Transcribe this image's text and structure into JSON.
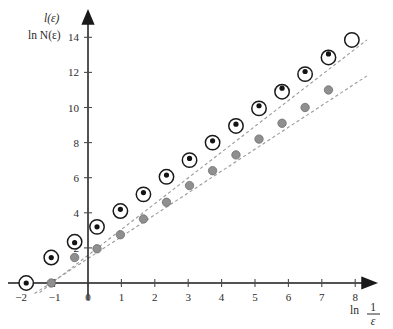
{
  "chart_data": {
    "type": "scatter",
    "title": "",
    "xlabel": "ln 1/ε",
    "ylabel_line1": "l(ε)",
    "ylabel_line2": "ln N(ε)",
    "xlim": [
      -2.4,
      8.6
    ],
    "ylim": [
      -0.9,
      14.9
    ],
    "xticks": [
      -2,
      -1,
      0,
      1,
      2,
      3,
      4,
      5,
      6,
      7,
      8
    ],
    "xticklabels": [
      "−2",
      "−1",
      "0",
      "1",
      "2",
      "3",
      "4",
      "5",
      "6",
      "7",
      "8"
    ],
    "yticks": [
      2,
      4,
      6,
      8,
      10,
      12,
      14
    ],
    "yticklabels": [
      "2",
      "4",
      "6",
      "8",
      "10",
      "12",
      "14"
    ],
    "grid": false,
    "legend": "none",
    "x": [
      -1.85,
      -1.1,
      -0.4,
      0.27,
      0.97,
      1.66,
      2.35,
      3.04,
      3.73,
      4.43,
      5.12,
      5.81,
      6.5,
      7.2,
      7.9
    ],
    "series": [
      {
        "name": "open-circles",
        "marker": "open-circle",
        "color": "#ffffff",
        "edge_color": "#1a1a1a",
        "size": 7.2,
        "values": [
          0.0,
          1.45,
          2.35,
          3.2,
          4.1,
          5.05,
          6.05,
          7.0,
          8.0,
          8.95,
          9.95,
          10.9,
          11.9,
          12.85,
          13.85
        ]
      },
      {
        "name": "black-dots",
        "marker": "filled-dot",
        "color": "#141414",
        "edge_color": "#141414",
        "size": 2.6,
        "values": [
          0.0,
          1.45,
          2.3,
          3.2,
          4.2,
          5.15,
          6.15,
          7.1,
          8.1,
          9.05,
          10.1,
          11.1,
          12.05,
          13.05,
          null
        ]
      },
      {
        "name": "gray-circles",
        "marker": "filled-circle",
        "color": "#8f8f8f",
        "edge_color": "#6f6f6f",
        "size": 4.2,
        "values": [
          0.0,
          0.0,
          1.45,
          1.95,
          2.75,
          3.65,
          4.6,
          5.55,
          6.4,
          7.3,
          8.2,
          9.1,
          10.0,
          11.0,
          null
        ]
      }
    ],
    "trendlines": [
      {
        "name": "upper-fit-line",
        "style": "dashed",
        "color": "#9a9a9a",
        "x_start": -1.45,
        "y_start": -0.55,
        "x_end": 8.35,
        "y_end": 13.85
      },
      {
        "name": "lower-fit-line",
        "style": "dashed",
        "color": "#9a9a9a",
        "x_start": -1.6,
        "y_start": -0.6,
        "x_end": 8.35,
        "y_end": 11.8
      }
    ]
  },
  "labels": {
    "y_axis_top": "l(ε)",
    "y_axis_bottom": "ln N(ε)",
    "x_axis_prefix": "ln",
    "x_axis_numerator": "1",
    "x_axis_denominator": "ε"
  }
}
